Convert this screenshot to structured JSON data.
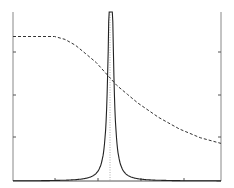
{
  "chart_data": {
    "type": "line",
    "title": "",
    "xlabel": "",
    "ylabel": "",
    "grid": false,
    "legend": null,
    "xlim": [
      0,
      1
    ],
    "ylim": [
      0,
      1
    ],
    "x_ticks_px": [
      55,
      98,
      141,
      184
    ],
    "y_ticks_px": [
      52,
      95,
      137
    ],
    "series": [
      {
        "name": "amplitude",
        "style": "solid",
        "shape": "resonance peak (Lorentzian)",
        "peak_x": 0.47,
        "points": [
          [
            0.0,
            0.0
          ],
          [
            0.1,
            0.005
          ],
          [
            0.2,
            0.02
          ],
          [
            0.3,
            0.06
          ],
          [
            0.35,
            0.12
          ],
          [
            0.4,
            0.3
          ],
          [
            0.44,
            0.65
          ],
          [
            0.46,
            0.9
          ],
          [
            0.47,
            1.0
          ],
          [
            0.48,
            0.9
          ],
          [
            0.5,
            0.55
          ],
          [
            0.55,
            0.32
          ],
          [
            0.6,
            0.2
          ],
          [
            0.7,
            0.11
          ],
          [
            0.8,
            0.07
          ],
          [
            0.9,
            0.05
          ],
          [
            1.0,
            0.04
          ]
        ]
      },
      {
        "name": "phase",
        "style": "dashed",
        "shape": "step-down transition",
        "points": [
          [
            0.0,
            0.5
          ],
          [
            0.1,
            0.5
          ],
          [
            0.2,
            0.5
          ],
          [
            0.25,
            0.49
          ],
          [
            0.3,
            0.47
          ],
          [
            0.35,
            0.44
          ],
          [
            0.4,
            0.41
          ],
          [
            0.45,
            0.37
          ],
          [
            0.5,
            0.33
          ],
          [
            0.55,
            0.3
          ],
          [
            0.6,
            0.27
          ],
          [
            0.7,
            0.22
          ],
          [
            0.8,
            0.18
          ],
          [
            0.9,
            0.15
          ],
          [
            1.0,
            0.13
          ]
        ]
      }
    ],
    "annotations": [
      {
        "type": "vertical-dotted-line",
        "x": 0.47,
        "label": ""
      }
    ]
  }
}
